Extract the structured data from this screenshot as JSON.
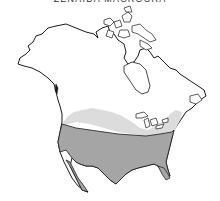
{
  "map": {
    "title": "ZENAIDA MACROURA",
    "region": "North America",
    "legend_colors": {
      "breeding_only": "#dcdcdc",
      "year_round": "#a5a5a5",
      "land": "#ffffff",
      "outline": "#1a1a1a"
    }
  }
}
